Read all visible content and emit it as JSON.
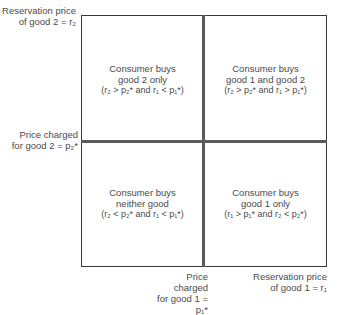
{
  "axes": {
    "y_label_top": [
      "Reservation price",
      "of good 2 = r₂"
    ],
    "y_label_mid": [
      "Price charged",
      "for good 2 = p₂*"
    ],
    "x_label_mid": [
      "Price charged",
      "for good 1 = p₁*"
    ],
    "x_label_right": [
      "Reservation price",
      "of good 1 = r₁"
    ]
  },
  "quadrants": {
    "top_left": {
      "line1": "Consumer buys",
      "line2": "good 2 only",
      "condition": "(r₂ > p₂* and r₁ < p₁*)"
    },
    "top_right": {
      "line1": "Consumer buys",
      "line2": "good 1 and good 2",
      "condition": "(r₂ > p₂* and r₁ > p₁*)"
    },
    "bottom_left": {
      "line1": "Consumer buys",
      "line2": "neither good",
      "condition": "(r₂ < p₂* and r₁ < p₁*)"
    },
    "bottom_right": {
      "line1": "Consumer buys",
      "line2": "good 1 only",
      "condition": "(r₁ > p₁* and r₂ < p₂*)"
    }
  },
  "colors": {
    "text": "#4a4a4a",
    "lines": "#5a5a5a"
  }
}
